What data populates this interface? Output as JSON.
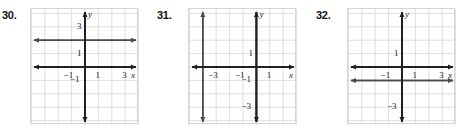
{
  "page": {
    "background_color": "#ffffff",
    "grid_line_color": "#d9d5d3",
    "grid_border_color": "#d8d4d2",
    "axis_color": "#231f20",
    "graph_line_color": "#4a4a4a"
  },
  "problems": [
    {
      "number": "30.",
      "grid": {
        "x_min": -4,
        "x_max": 4,
        "y_min": -4,
        "y_max": 4,
        "cell_px": 13.4
      },
      "x_axis_label": "x",
      "y_axis_label": "y",
      "x_tick_labels": [
        {
          "text": "−1",
          "value": -1
        },
        {
          "text": "1",
          "value": 1
        },
        {
          "text": "3",
          "value": 3
        }
      ],
      "y_tick_labels": [
        {
          "text": "3",
          "value": 3
        },
        {
          "text": "1",
          "value": 1
        },
        {
          "text": "−1",
          "value": -1
        }
      ],
      "graph_lines": [
        {
          "orientation": "horizontal",
          "equation": "y = 2",
          "value": 2
        }
      ]
    },
    {
      "number": "31.",
      "grid": {
        "x_min": -5,
        "x_max": 3,
        "y_min": -4,
        "y_max": 4,
        "cell_px": 13.4
      },
      "x_axis_label": "x",
      "y_axis_label": "y",
      "x_tick_labels": [
        {
          "text": "−3",
          "value": -3
        },
        {
          "text": "−1",
          "value": -1
        },
        {
          "text": "1",
          "value": 1
        }
      ],
      "y_tick_labels": [
        {
          "text": "1",
          "value": 1
        },
        {
          "text": "−1",
          "value": -1
        },
        {
          "text": "−3",
          "value": -3
        }
      ],
      "graph_lines": [
        {
          "orientation": "vertical",
          "equation": "x = -4",
          "value": -4
        }
      ]
    },
    {
      "number": "32.",
      "grid": {
        "x_min": -4,
        "x_max": 4,
        "y_min": -4,
        "y_max": 4,
        "cell_px": 13.4
      },
      "x_axis_label": "x",
      "y_axis_label": "y",
      "x_tick_labels": [
        {
          "text": "−1",
          "value": -1
        },
        {
          "text": "1",
          "value": 1
        },
        {
          "text": "3",
          "value": 3
        }
      ],
      "y_tick_labels": [
        {
          "text": "1",
          "value": 1
        },
        {
          "text": "−3",
          "value": -3
        }
      ],
      "graph_lines": [
        {
          "orientation": "horizontal",
          "equation": "y = -1",
          "value": -1
        }
      ]
    }
  ],
  "layout": {
    "problem_offsets_px": [
      0,
      155,
      312
    ],
    "number_offsets_px": [
      2,
      2,
      4
    ],
    "frame_offset_px": [
      30,
      33,
      35
    ],
    "frame_top_px": 8,
    "frame_width_px": 108,
    "frame_height_px": 116
  }
}
